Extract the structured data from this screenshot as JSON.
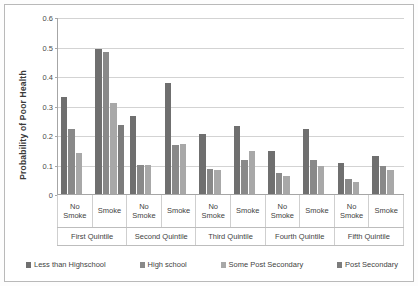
{
  "chart_data": {
    "type": "bar",
    "title": "",
    "xlabel": "",
    "ylabel": "Probability of Poor Health",
    "ylim": [
      0,
      0.6
    ],
    "ytick_labels": [
      "0",
      "0.1",
      "0.2",
      "0.3",
      "0.4",
      "0.5",
      "0.6"
    ],
    "ytick_values": [
      0,
      0.1,
      0.2,
      0.3,
      0.4,
      0.5,
      0.6
    ],
    "grid": true,
    "legend_position": "bottom",
    "categories": [
      "No Smoke",
      "Smoke",
      "No Smoke",
      "Smoke",
      "No Smoke",
      "Smoke",
      "No Smoke",
      "Smoke",
      "No Smoke",
      "Smoke"
    ],
    "group_labels": [
      "First Quintile",
      "Second Quintile",
      "Third Quintile",
      "Fourth Quintile",
      "Fifth Quintile"
    ],
    "series": [
      {
        "name": "Less than Highschool",
        "color": "#6f6f6f",
        "values": [
          0.33,
          0.49,
          0.265,
          0.375,
          0.205,
          0.23,
          0.145,
          0.22,
          0.105,
          0.13
        ]
      },
      {
        "name": "High school",
        "color": "#898989",
        "values": [
          0.22,
          0.48,
          0.1,
          0.165,
          0.085,
          0.115,
          0.07,
          0.115,
          0.05,
          0.095
        ]
      },
      {
        "name": "Some Post Secondary",
        "color": "#a8a8a8",
        "values": [
          0.14,
          0.31,
          0.1,
          0.17,
          0.08,
          0.145,
          0.06,
          0.095,
          0.04,
          0.08
        ]
      },
      {
        "name": "Post Secondary",
        "color": "#7c7c7c",
        "values": [
          0.0,
          0.235,
          0.0,
          0.0,
          0.0,
          0.0,
          0.0,
          0.0,
          0.0,
          0.0
        ]
      }
    ]
  }
}
